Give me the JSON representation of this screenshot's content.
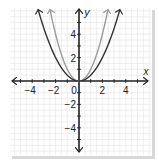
{
  "chart_data": {
    "type": "line",
    "title": "",
    "xlabel": "x",
    "ylabel": "y",
    "xlim": [
      -6,
      6
    ],
    "ylim": [
      -6,
      6
    ],
    "grid": true,
    "grid_step": 0.5,
    "x_ticks": [
      -4,
      -2,
      2,
      4
    ],
    "y_ticks": [
      4,
      2,
      -2,
      -4
    ],
    "x_tick_labels": [
      "−4",
      "−2",
      "2",
      "4"
    ],
    "y_tick_labels": [
      "4",
      "2",
      "−2",
      "−4"
    ],
    "origin_label": "0",
    "legend": null,
    "series": [
      {
        "name": "y = x²",
        "color": "#9a9a9a",
        "formula": "x^2",
        "x": [
          -2.45,
          -2,
          -1.5,
          -1,
          -0.5,
          0,
          0.5,
          1,
          1.5,
          2,
          2.45
        ],
        "values": [
          6.0,
          4,
          2.25,
          1,
          0.25,
          0,
          0.25,
          1,
          2.25,
          4,
          6.0
        ],
        "arrows_at_ends": true
      },
      {
        "name": "y = ½x²",
        "color": "#333333",
        "formula": "0.5*x^2",
        "x": [
          -3.46,
          -3,
          -2,
          -1,
          0,
          1,
          2,
          3,
          3.46
        ],
        "values": [
          6.0,
          4.5,
          2,
          0.5,
          0,
          0.5,
          2,
          4.5,
          6.0
        ],
        "arrows_at_ends": true
      }
    ]
  },
  "axes": {
    "x_label": "x",
    "y_label": "y",
    "origin": "0"
  }
}
